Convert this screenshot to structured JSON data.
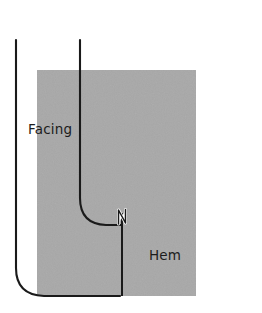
{
  "diagram": {
    "type": "technical-sewing-illustration",
    "canvas": {
      "width": 262,
      "height": 313,
      "background": "#ffffff"
    },
    "colors": {
      "fabric_fill": "#a8a8a8",
      "stitch_line": "#1a1a1a",
      "label_text": "#1c1c1c",
      "notch_fill": "#ffffff",
      "background": "#ffffff"
    },
    "labels": {
      "facing": "Facing",
      "hem": "Hem"
    },
    "fabric_panel": {
      "name": "fabric-panel",
      "x": 37,
      "y": 70,
      "width": 159,
      "height": 226,
      "fill": "#a8a8a8"
    },
    "lines": [
      {
        "name": "facing-edge-line",
        "description": "outer vertical line curving to bottom horizontal",
        "x": 16,
        "top_y": 14,
        "bottom_y": 296
      },
      {
        "name": "facing-fold-line",
        "description": "inner vertical line curving right into hem line",
        "x": 80,
        "top_y": 14,
        "corner_y": 225
      },
      {
        "name": "hem-line",
        "description": "horizontal line running right from the corner",
        "y": 225,
        "from_x": 80,
        "to_x": 258
      },
      {
        "name": "bottom-edge-line",
        "description": "bottom horizontal line",
        "y": 296,
        "from_x": 36,
        "to_x": 255
      },
      {
        "name": "center-seam-line",
        "description": "short vertical seam below the notch",
        "x": 122,
        "from_y": 212,
        "to_y": 296
      }
    ],
    "notch": {
      "name": "notch-mark",
      "label": "N",
      "x": 118,
      "y": 209,
      "width": 10,
      "height": 16,
      "fill": "#ffffff"
    }
  }
}
